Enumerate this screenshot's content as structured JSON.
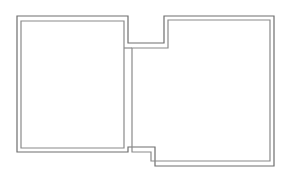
{
  "diagram": {
    "type": "floor-plan",
    "canvas": {
      "width": 282,
      "height": 179,
      "background": "#ffffff"
    },
    "colors": {
      "outer_wall": "#6e6e6e",
      "inner_wall": "#8a8a8a"
    },
    "rooms": [
      {
        "name": "left-room",
        "label": ""
      },
      {
        "name": "right-room",
        "label": ""
      }
    ],
    "walls": {
      "outer_path": "M17,16 L128,16 L128,43 L164,43 L164,16 L274,16 L274,166 L155,166 L155,147 L128,147 L128,152 L17,152 Z",
      "inner_left_room": "M21,21 L124,21 L124,148 L21,148 Z",
      "inner_right_room": "M168,20 L270,20 L270,161 L151,161 L151,152 L132,152 L132,48 L168,48 Z",
      "divider_line": "M124,48 L132,48"
    }
  }
}
